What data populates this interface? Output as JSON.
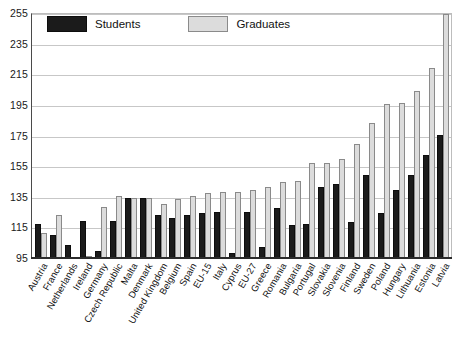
{
  "chart_data": {
    "type": "bar",
    "title": "",
    "subtitle": "",
    "xlabel": "",
    "ylabel": "",
    "ylim": [
      95,
      255
    ],
    "yticks": [
      95,
      115,
      135,
      155,
      175,
      195,
      215,
      235,
      255
    ],
    "grid": "horizontal",
    "legend_position": "top-left",
    "categories": [
      "Austria",
      "France",
      "Netherlands",
      "Ireland",
      "Germany",
      "Czech Republic",
      "Malta",
      "Denmark",
      "United Kingdom",
      "Belgium",
      "Spain",
      "EU-15",
      "Italy",
      "Cyprus",
      "EU-27",
      "Greece",
      "Romania",
      "Bulgaria",
      "Portugal",
      "Slovakia",
      "Slovenia",
      "Finland",
      "Sweden",
      "Poland",
      "Hungary",
      "Lithuania",
      "Estonia",
      "Latvia"
    ],
    "series": [
      {
        "name": "Students",
        "color": "#1b1b1b",
        "values": [
          118,
          111,
          104,
          120,
          100,
          120,
          135,
          135,
          124,
          122,
          124,
          125,
          126,
          99,
          126,
          103,
          128,
          117,
          118,
          142,
          144,
          119,
          150,
          125,
          140,
          150,
          163,
          176
        ]
      },
      {
        "name": "Graduates",
        "color": "#dcdcdc",
        "values": [
          112,
          124,
          96,
          97,
          129,
          136,
          135,
          135,
          131,
          134,
          136,
          138,
          139,
          139,
          140,
          142,
          145,
          146,
          158,
          158,
          160,
          170,
          184,
          196,
          197,
          205,
          220,
          255
        ]
      }
    ]
  },
  "legend": {
    "entries": [
      {
        "label": "Students"
      },
      {
        "label": "Graduates"
      }
    ]
  }
}
